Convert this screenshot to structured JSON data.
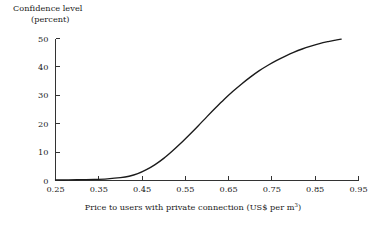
{
  "chart_data": {
    "type": "line",
    "title": "",
    "ylabel_line1": "Confidence level",
    "ylabel_line2": "(percent)",
    "xlabel_main": "Price to users with private connection (US$ per m",
    "xlabel_superscript": "3",
    "xlabel_tail": ")",
    "xlabel_full": "Price to users with private connection (US$ per m³)",
    "xlim": [
      0.25,
      0.95
    ],
    "ylim": [
      0,
      50
    ],
    "xticks": [
      0.25,
      0.35,
      0.45,
      0.55,
      0.65,
      0.75,
      0.85,
      0.95
    ],
    "xtick_labels": [
      "0.25",
      "0.35",
      "0.45",
      "0.55",
      "0.65",
      "0.75",
      "0.85",
      "0.95"
    ],
    "yticks": [
      0,
      10,
      20,
      30,
      40,
      50
    ],
    "ytick_labels": [
      "0",
      "10",
      "20",
      "30",
      "40",
      "50"
    ],
    "grid": false,
    "legend": "none",
    "line_color": "#1a1a1a",
    "axis_color": "#333333",
    "background": "#ffffff",
    "series": [
      {
        "name": "Confidence level",
        "x": [
          0.25,
          0.28,
          0.31,
          0.34,
          0.37,
          0.4,
          0.42,
          0.44,
          0.46,
          0.48,
          0.5,
          0.52,
          0.54,
          0.56,
          0.58,
          0.6,
          0.62,
          0.64,
          0.66,
          0.68,
          0.7,
          0.72,
          0.74,
          0.76,
          0.78,
          0.8,
          0.82,
          0.84,
          0.86,
          0.88,
          0.9,
          0.91
        ],
        "values": [
          0.2,
          0.2,
          0.3,
          0.4,
          0.6,
          1.0,
          1.5,
          2.4,
          3.8,
          5.6,
          7.8,
          10.4,
          13.2,
          16.2,
          19.3,
          22.5,
          25.6,
          28.6,
          31.4,
          34.0,
          36.4,
          38.6,
          40.5,
          42.2,
          43.7,
          45.1,
          46.3,
          47.3,
          48.2,
          48.9,
          49.5,
          49.8
        ]
      }
    ]
  }
}
